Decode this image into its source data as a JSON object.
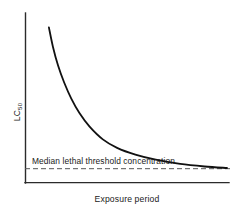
{
  "chart_data": {
    "type": "line",
    "title": "",
    "subtitle": "",
    "xlabel": "Exposure period",
    "ylabel": "LC",
    "ylabel_subscript": "50",
    "ylabel_full": "LC50",
    "grid": false,
    "legend_position": "none",
    "xlim": [
      0,
      1
    ],
    "ylim": [
      0,
      1
    ],
    "xticks": [],
    "yticks": [],
    "xticklabels": [],
    "yticklabels": [],
    "series": [
      {
        "name": "LC50 decay curve",
        "style": "solid",
        "color": "#111111",
        "x": [
          0.115,
          0.135,
          0.16,
          0.19,
          0.225,
          0.265,
          0.315,
          0.38,
          0.45,
          0.54,
          0.64,
          0.76,
          0.88,
          0.99
        ],
        "y": [
          0.915,
          0.8,
          0.69,
          0.59,
          0.495,
          0.41,
          0.33,
          0.255,
          0.205,
          0.165,
          0.135,
          0.11,
          0.095,
          0.086
        ]
      },
      {
        "name": "Median lethal threshold concentration",
        "style": "dashed",
        "color": "#555555",
        "x": [
          0.0,
          1.0
        ],
        "y": [
          0.082,
          0.082
        ]
      }
    ],
    "annotations": [
      {
        "text": "Median lethal threshold concentration",
        "x": 0.06,
        "y": 0.02,
        "anchor": "start"
      }
    ]
  },
  "axes": {
    "y_label": "LC",
    "y_label_subscript": "50",
    "x_label": "Exposure period"
  },
  "annotation": {
    "threshold_label": "Median lethal threshold concentration"
  },
  "colors": {
    "axis": "#2b2b2b",
    "curve": "#111111",
    "threshold": "#555555",
    "background": "#ffffff",
    "text": "#1a1a1a"
  }
}
